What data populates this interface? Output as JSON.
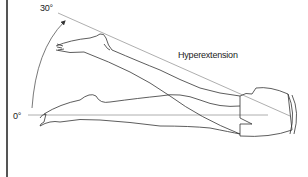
{
  "diagram": {
    "title_cut_off": "",
    "labels": {
      "angle_top": "30°",
      "angle_bottom": "0°",
      "movement": "Hyperextension"
    },
    "colors": {
      "line": "#333333",
      "reference_line": "#999999",
      "border": "#555555",
      "background": "#ffffff"
    }
  }
}
